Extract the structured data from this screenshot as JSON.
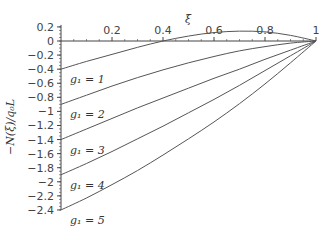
{
  "chart_data": {
    "type": "line",
    "title": "",
    "xlabel": "ξ",
    "ylabel": "−N(ξ)/q₀L",
    "xlim": [
      0,
      1
    ],
    "ylim": [
      -2.4,
      0.2
    ],
    "x_ticks": [
      "0.2",
      "0.4",
      "0.6",
      "0.8",
      "1"
    ],
    "y_ticks": [
      "0.2",
      "0",
      "−0.2",
      "−0.4",
      "−0.6",
      "−0.8",
      "−1",
      "−1.2",
      "−1.4",
      "−1.6",
      "−1.8",
      "−2",
      "−2.2",
      "−2.4"
    ],
    "grid": false,
    "legend": "none (inline annotations)",
    "x": [
      0,
      0.1,
      0.2,
      0.3,
      0.4,
      0.5,
      0.6,
      0.7,
      0.8,
      0.9,
      1.0
    ],
    "series": [
      {
        "name": "g1 = 1",
        "label": "g₁ = 1",
        "values": [
          -0.4,
          -0.29,
          -0.19,
          -0.09,
          0.0,
          0.07,
          0.12,
          0.14,
          0.13,
          0.08,
          0.0
        ]
      },
      {
        "name": "g1 = 2",
        "label": "g₁ = 2",
        "values": [
          -0.9,
          -0.77,
          -0.64,
          -0.52,
          -0.41,
          -0.31,
          -0.22,
          -0.14,
          -0.08,
          -0.03,
          0.0
        ]
      },
      {
        "name": "g1 = 3",
        "label": "g₁ = 3",
        "values": [
          -1.4,
          -1.25,
          -1.1,
          -0.95,
          -0.81,
          -0.67,
          -0.53,
          -0.4,
          -0.26,
          -0.13,
          0.0
        ]
      },
      {
        "name": "g1 = 4",
        "label": "g₁ = 4",
        "values": [
          -1.9,
          -1.74,
          -1.57,
          -1.39,
          -1.21,
          -1.02,
          -0.83,
          -0.63,
          -0.42,
          -0.21,
          0.0
        ]
      },
      {
        "name": "g1 = 5",
        "label": "g₁ = 5",
        "values": [
          -2.4,
          -2.23,
          -2.04,
          -1.84,
          -1.62,
          -1.39,
          -1.15,
          -0.89,
          -0.61,
          -0.31,
          0.0
        ]
      }
    ]
  },
  "axis": {
    "xlabel": "ξ",
    "ylabel": "−N(ξ)/q₀L",
    "x_ticks": [
      "0.2",
      "0.4",
      "0.6",
      "0.8",
      "1"
    ],
    "y_ticks": [
      "0.2",
      "0",
      "−0.2",
      "−0.4",
      "−0.6",
      "−0.8",
      "−1",
      "−1.2",
      "−1.4",
      "−1.6",
      "−1.8",
      "−2",
      "−2.2",
      "−2.4"
    ]
  },
  "annotations": [
    "g₁ = 1",
    "g₁ = 2",
    "g₁ = 3",
    "g₁ = 4",
    "g₁ = 5"
  ],
  "colors": {
    "curve": "#555555",
    "axis": "#444444",
    "text": "#444444"
  }
}
